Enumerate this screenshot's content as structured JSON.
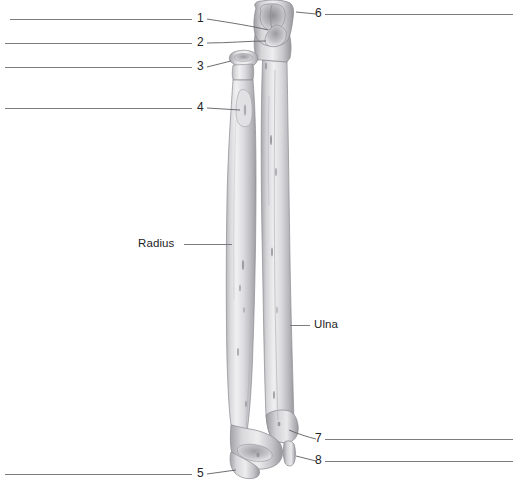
{
  "figure": {
    "background_color": "#ffffff",
    "line_color": "#7c7c80",
    "text_color": "#232326",
    "bone_fill_light": "#f2f2f2",
    "bone_fill_mid": "#cfcfd1",
    "bone_fill_dark": "#9b9b9f"
  },
  "labels": {
    "n1": "1",
    "n2": "2",
    "n3": "3",
    "n4": "4",
    "n5": "5",
    "n6": "6",
    "n7": "7",
    "n8": "8",
    "radius": "Radius",
    "ulna": "Ulna"
  },
  "leader_lines": [
    {
      "id": "line-1",
      "label": "1",
      "side": "left",
      "x1": 10,
      "y1": 19,
      "x2": 192,
      "y2": 19
    },
    {
      "id": "line-2",
      "label": "2",
      "side": "left",
      "x1": 5,
      "y1": 43,
      "x2": 192,
      "y2": 43
    },
    {
      "id": "line-3",
      "label": "3",
      "side": "left",
      "x1": 5,
      "y1": 67,
      "x2": 192,
      "y2": 67
    },
    {
      "id": "line-4",
      "label": "4",
      "side": "left",
      "x1": 5,
      "y1": 108,
      "x2": 192,
      "y2": 108
    },
    {
      "id": "line-5",
      "label": "5",
      "side": "left",
      "x1": 5,
      "y1": 474,
      "x2": 192,
      "y2": 474
    },
    {
      "id": "line-6",
      "label": "6",
      "side": "right",
      "x1": 325,
      "y1": 14,
      "x2": 513,
      "y2": 14
    },
    {
      "id": "line-7",
      "label": "7",
      "side": "right",
      "x1": 325,
      "y1": 439,
      "x2": 513,
      "y2": 439
    },
    {
      "id": "line-8",
      "label": "8",
      "side": "right",
      "x1": 325,
      "y1": 461,
      "x2": 513,
      "y2": 461
    }
  ],
  "named_labels": [
    {
      "id": "label-radius",
      "text": "Radius",
      "x": 138,
      "y": 240,
      "leader_x1": 184,
      "leader_x2": 232,
      "leader_y": 244
    },
    {
      "id": "label-ulna",
      "text": "Ulna",
      "x": 314,
      "y": 321,
      "leader_x1": 290,
      "leader_x2": 310,
      "leader_y": 325
    }
  ],
  "bones": [
    {
      "name": "radius",
      "position": "left",
      "description": "Radius: head and neck proximally, radial tuberosity, long shaft widening to distal end with styloid process"
    },
    {
      "name": "ulna",
      "position": "right",
      "description": "Ulna: olecranon and trochlear notch proximally, long shaft, distal head with styloid process"
    }
  ]
}
